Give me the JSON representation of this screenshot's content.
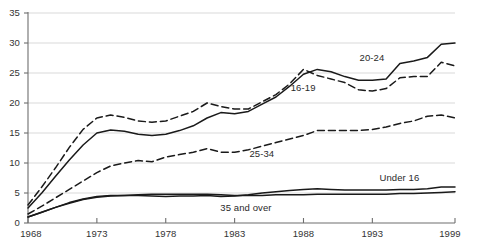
{
  "chart_data": {
    "type": "line",
    "title": "",
    "subtitle": "",
    "xlabel": "",
    "ylabel": "",
    "xlim": [
      1968,
      1999
    ],
    "ylim": [
      0,
      35
    ],
    "grid": true,
    "legend_position": "inline-annotations",
    "x_ticks": [
      "1968",
      "1973",
      "1978",
      "1983",
      "1988",
      "1993",
      "1999"
    ],
    "x_tick_values": [
      1968,
      1973,
      1978,
      1983,
      1988,
      1993,
      1999
    ],
    "y_ticks": [
      "0",
      "5",
      "10",
      "15",
      "20",
      "25",
      "30",
      "35"
    ],
    "y_tick_values": [
      0,
      5,
      10,
      15,
      20,
      25,
      30,
      35
    ],
    "x": [
      1968,
      1969,
      1970,
      1971,
      1972,
      1973,
      1974,
      1975,
      1976,
      1977,
      1978,
      1979,
      1980,
      1981,
      1982,
      1983,
      1984,
      1985,
      1986,
      1987,
      1988,
      1989,
      1990,
      1991,
      1992,
      1993,
      1994,
      1995,
      1996,
      1997,
      1998,
      1999
    ],
    "series": [
      {
        "name": "20-24",
        "style": "solid",
        "color": "#1a1a1a",
        "label": "20-24",
        "label_x": 1993,
        "label_y": 27.5,
        "values": [
          2.5,
          5.0,
          7.8,
          10.5,
          13.0,
          15.0,
          15.5,
          15.3,
          14.8,
          14.6,
          14.8,
          15.4,
          16.2,
          17.5,
          18.4,
          18.2,
          18.6,
          19.8,
          21.0,
          22.8,
          24.8,
          25.6,
          25.2,
          24.4,
          23.8,
          23.8,
          24.0,
          26.6,
          27.0,
          27.6,
          29.8,
          30.0
        ]
      },
      {
        "name": "16-19",
        "style": "dashed",
        "color": "#1a1a1a",
        "label": "16-19",
        "label_x": 1988,
        "label_y": 22.5,
        "values": [
          3.0,
          6.0,
          9.2,
          12.6,
          15.6,
          17.5,
          18.0,
          17.6,
          17.0,
          16.8,
          17.0,
          17.8,
          18.6,
          20.0,
          19.4,
          19.0,
          19.0,
          20.2,
          21.4,
          23.2,
          25.6,
          24.6,
          24.0,
          23.4,
          22.2,
          22.0,
          22.4,
          24.2,
          24.4,
          24.4,
          26.8,
          26.2
        ]
      },
      {
        "name": "25-34",
        "style": "dashed",
        "color": "#1a1a1a",
        "label": "25-34",
        "label_x": 1985,
        "label_y": 11.5,
        "values": [
          1.5,
          2.8,
          4.2,
          5.6,
          7.0,
          8.4,
          9.5,
          10.0,
          10.4,
          10.2,
          11.0,
          11.4,
          11.8,
          12.4,
          11.8,
          11.8,
          12.2,
          12.8,
          13.4,
          14.0,
          14.6,
          15.4,
          15.4,
          15.4,
          15.4,
          15.6,
          16.0,
          16.6,
          17.0,
          17.8,
          18.0,
          17.5
        ]
      },
      {
        "name": "Under 16",
        "style": "solid",
        "color": "#1a1a1a",
        "label": "Under 16",
        "label_x": 1995,
        "label_y": 7.5,
        "values": [
          1.0,
          1.8,
          2.6,
          3.4,
          4.0,
          4.4,
          4.6,
          4.6,
          4.6,
          4.5,
          4.4,
          4.5,
          4.5,
          4.6,
          4.4,
          4.5,
          4.7,
          5.0,
          5.2,
          5.4,
          5.6,
          5.7,
          5.6,
          5.5,
          5.5,
          5.5,
          5.5,
          5.6,
          5.6,
          5.7,
          6.0,
          6.0
        ]
      },
      {
        "name": "35 and over",
        "style": "solid",
        "color": "#1a1a1a",
        "label": "35 and over",
        "label_x": 1984,
        "label_y": 2.4,
        "values": [
          1.0,
          1.8,
          2.6,
          3.3,
          3.9,
          4.3,
          4.5,
          4.6,
          4.7,
          4.8,
          4.8,
          4.8,
          4.8,
          4.8,
          4.7,
          4.6,
          4.6,
          4.6,
          4.7,
          4.7,
          4.7,
          4.8,
          4.8,
          4.8,
          4.8,
          4.8,
          4.8,
          4.9,
          4.9,
          5.0,
          5.1,
          5.2
        ]
      }
    ]
  },
  "style": {
    "grid_color": "#cfcfcf",
    "axis_color": "#6e6e6e",
    "line_color": "#1a1a1a",
    "background": "#ffffff"
  }
}
